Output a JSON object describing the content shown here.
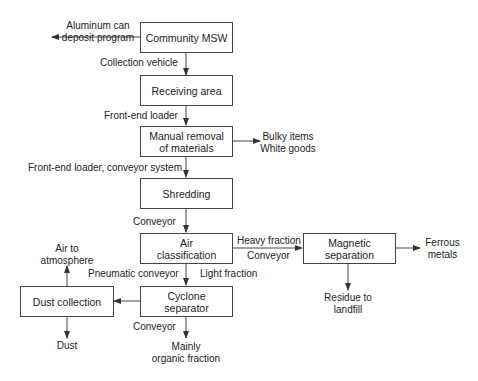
{
  "diagram": {
    "type": "process-flow",
    "boxes": {
      "community_msw": "Community MSW",
      "receiving_area": "Receiving area",
      "manual_removal": "Manual removal of materials",
      "shredding": "Shredding",
      "air_classification": "Air classification",
      "magnetic_separation": "Magnetic separation",
      "cyclone_separator": "Cyclone separator",
      "dust_collection": "Dust collection"
    },
    "box_lines": {
      "manual_removal": [
        "Manual removal",
        "of materials"
      ],
      "air_classification": [
        "Air",
        "classification"
      ],
      "magnetic_separation": [
        "Magnetic",
        "separation"
      ],
      "cyclone_separator": [
        "Cyclone",
        "separator"
      ]
    },
    "edge_labels": {
      "collection_vehicle": "Collection vehicle",
      "front_end_loader": "Front-end loader",
      "front_end_loader_conveyor": "Front-end loader, conveyor system",
      "conveyor_1": "Conveyor",
      "heavy_fraction": "Heavy fraction",
      "conveyor_2": "Conveyor",
      "pneumatic_conveyor": "Pneumatic conveyor",
      "light_fraction": "Light fraction",
      "conveyor_3": "Conveyor"
    },
    "outputs": {
      "aluminum": [
        "Aluminum can",
        "deposit program"
      ],
      "bulky": [
        "Bulky items",
        "White goods"
      ],
      "ferrous": [
        "Ferrous",
        "metals"
      ],
      "residue": [
        "Residue to",
        "landfill"
      ],
      "air": [
        "Air to",
        "atmosphere"
      ],
      "dust": "Dust",
      "organic": [
        "Mainly",
        "organic fraction"
      ]
    }
  }
}
